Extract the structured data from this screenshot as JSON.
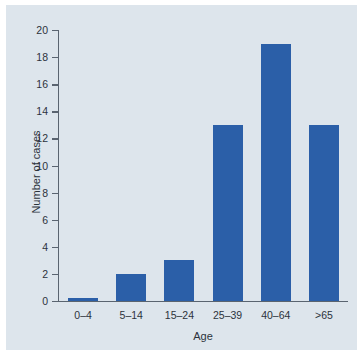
{
  "chart_data": {
    "type": "bar",
    "title": "",
    "subtitle": "",
    "xlabel": "Age",
    "ylabel": "Number of cases",
    "categories": [
      "0–4",
      "5–14",
      "15–24",
      "25–39",
      "40–64",
      ">65"
    ],
    "values": [
      0.2,
      2,
      3,
      13,
      19,
      13
    ],
    "series": [
      {
        "name": "Number of cases",
        "values": [
          0.2,
          2,
          3,
          13,
          19,
          13
        ]
      }
    ],
    "ylim": [
      0,
      20
    ],
    "ytick_step": 2,
    "yticks": [
      0,
      2,
      4,
      6,
      8,
      10,
      12,
      14,
      16,
      18,
      20
    ],
    "ytick_labels": [
      "0",
      "2",
      "4",
      "6",
      "8",
      "10",
      "12",
      "14",
      "16",
      "18",
      "20"
    ],
    "grid": false,
    "legend": false,
    "legend_position": "none",
    "annotations": [],
    "colors": {
      "bar": "#2b5fa8",
      "plot_background": "#dde5ec",
      "page_background": "#ffffff",
      "axis": "#5a6470",
      "text": "#2c333c"
    }
  }
}
